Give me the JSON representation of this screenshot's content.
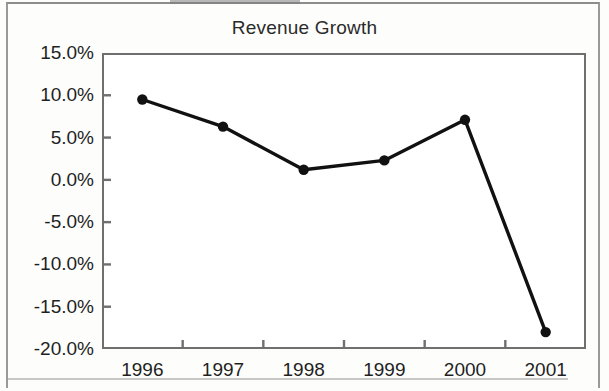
{
  "chart_data": {
    "type": "line",
    "title": "Revenue Growth",
    "xlabel": "",
    "ylabel": "",
    "categories": [
      "1996",
      "1997",
      "1998",
      "1999",
      "2000",
      "2001"
    ],
    "values": [
      9.5,
      6.3,
      1.2,
      2.3,
      7.1,
      -18.0
    ],
    "series": [
      {
        "name": "Revenue Growth",
        "values": [
          9.5,
          6.3,
          1.2,
          2.3,
          7.1,
          -18.0
        ]
      }
    ],
    "y_tick_labels": [
      "15.0%",
      "10.0%",
      "5.0%",
      "0.0%",
      "-5.0%",
      "-10.0%",
      "-15.0%",
      "-20.0%"
    ],
    "y_tick_values": [
      15,
      10,
      5,
      0,
      -5,
      -10,
      -15,
      -20
    ],
    "ylim": [
      -20,
      15
    ],
    "y_unit": "%",
    "grid": false,
    "legend": false,
    "legend_position": "none",
    "marker": "filled-circle",
    "line_color": "#111111",
    "marker_color": "#111111",
    "axis_color": "#6f6f6f",
    "text_color": "#1f1f1f",
    "background_color": "#ffffff"
  }
}
